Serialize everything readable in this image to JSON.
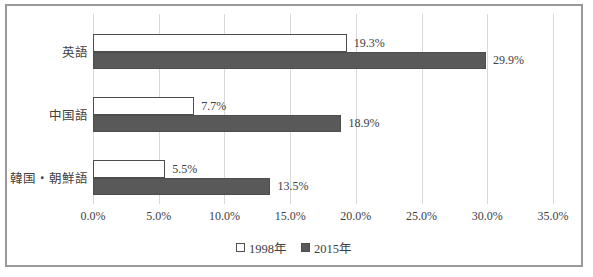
{
  "chart_data": {
    "type": "bar",
    "orientation": "horizontal",
    "title": "",
    "xlabel": "",
    "ylabel": "",
    "categories": [
      "英語",
      "中国語",
      "韓国・朝鮮語"
    ],
    "series": [
      {
        "name": "1998年",
        "values": [
          19.3,
          7.7,
          5.5
        ],
        "value_labels": [
          "19.3%",
          "7.7%",
          "5.5%"
        ],
        "fill": "#ffffff",
        "border": "#4d4d4d"
      },
      {
        "name": "2015年",
        "values": [
          29.9,
          18.9,
          13.5
        ],
        "value_labels": [
          "29.9%",
          "18.9%",
          "13.5%"
        ],
        "fill": "#595959",
        "border": "#4d4d4d"
      }
    ],
    "xlim": [
      0,
      35
    ],
    "x_ticks": [
      "0.0%",
      "5.0%",
      "10.0%",
      "15.0%",
      "20.0%",
      "25.0%",
      "30.0%",
      "35.0%"
    ],
    "grid": "vertical",
    "legend_position": "bottom"
  },
  "colors": {
    "gridline": "#d9d9d9",
    "text": "#404040",
    "frame_border": "#999999"
  }
}
